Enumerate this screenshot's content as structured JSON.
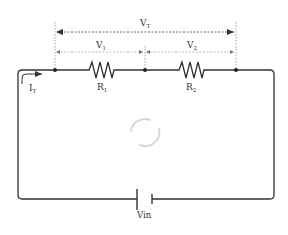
{
  "diagram": {
    "type": "series-circuit",
    "labels": {
      "total_voltage": "V",
      "total_voltage_sub": "T",
      "v1": "V",
      "v1_sub": "1",
      "v2": "V",
      "v2_sub": "2",
      "r1": "R",
      "r1_sub": "1",
      "r2": "R",
      "r2_sub": "2",
      "current": "I",
      "current_sub": "T",
      "source": "Vin"
    },
    "components": [
      {
        "id": "R1",
        "type": "resistor"
      },
      {
        "id": "R2",
        "type": "resistor"
      },
      {
        "id": "Vin",
        "type": "battery"
      }
    ],
    "colors": {
      "wire": "#333333",
      "dim_line": "#999999",
      "text": "#333333",
      "loading": "#d8d8d8"
    }
  }
}
